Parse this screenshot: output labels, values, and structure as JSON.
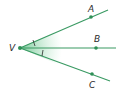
{
  "diagram": {
    "colors": {
      "ray": "#3a9a63",
      "point": "#2f8f57",
      "shade": "#7fcf9c",
      "label": "#2b2b2b"
    },
    "vertex": {
      "label": "V",
      "x": 20,
      "y": 48
    },
    "rays": [
      {
        "name": "VA",
        "point_label": "A",
        "point": [
          91,
          17
        ],
        "end": [
          108,
          10
        ],
        "label_pos": [
          88,
          12
        ]
      },
      {
        "name": "VB",
        "point_label": "B",
        "point": [
          96,
          48
        ],
        "end": [
          116,
          48
        ],
        "label_pos": [
          94,
          42
        ]
      },
      {
        "name": "VC",
        "point_label": "C",
        "point": [
          92,
          74
        ],
        "end": [
          110,
          81
        ],
        "label_pos": [
          89,
          88
        ]
      }
    ],
    "angle_marks": [
      {
        "between": [
          "VA",
          "VB"
        ],
        "ticks": 1
      },
      {
        "between": [
          "VB",
          "VC"
        ],
        "ticks": 1
      }
    ]
  }
}
